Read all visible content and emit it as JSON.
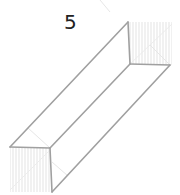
{
  "figure": {
    "label": "5",
    "colors": {
      "edge": "#9a9a9a",
      "hatch": "#e2e2e2",
      "hidden": "#e4e4e4",
      "label": "#222222"
    }
  }
}
